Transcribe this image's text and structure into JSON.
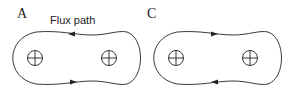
{
  "panels": [
    {
      "label": "A",
      "annotation": "Flux path",
      "direction": "counterclockwise",
      "conductors": [
        {
          "symbol": "circle-plus"
        },
        {
          "symbol": "circle-plus"
        }
      ]
    },
    {
      "label": "C",
      "direction": "clockwise",
      "conductors": [
        {
          "symbol": "circle-plus"
        },
        {
          "symbol": "circle-plus"
        }
      ]
    }
  ],
  "colors": {
    "line": "#222222",
    "background": "#ffffff"
  }
}
